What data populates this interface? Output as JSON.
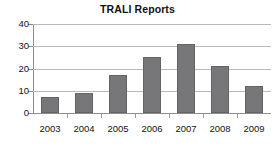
{
  "chart_data": {
    "type": "bar",
    "title": "TRALI Reports",
    "xlabel": "",
    "ylabel": "",
    "categories": [
      "2003",
      "2004",
      "2005",
      "2006",
      "2007",
      "2008",
      "2009"
    ],
    "values": [
      7,
      9,
      17,
      25,
      31,
      21,
      12
    ],
    "series": [
      {
        "name": "TRALI Reports",
        "values": [
          7,
          9,
          17,
          25,
          31,
          21,
          12
        ]
      }
    ],
    "ylim": [
      0,
      40
    ],
    "yticks": [
      0,
      10,
      20,
      30,
      40
    ],
    "ytick_labels": [
      "0",
      "10",
      "20",
      "30",
      "40"
    ],
    "grid": true,
    "legend": false,
    "legend_position": "none",
    "colors": {
      "bar_fill": "#77777a",
      "bar_border": "#636366",
      "gridline": "#b9b9bb",
      "axis": "#8d8d90",
      "text": "#141414",
      "background": "#ffffff"
    }
  }
}
